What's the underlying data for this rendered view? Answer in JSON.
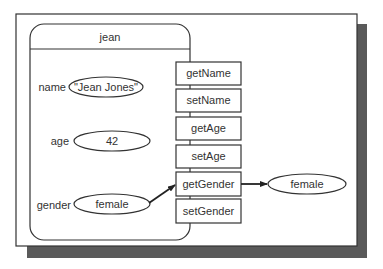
{
  "colors": {
    "line": "#333333",
    "shadow": "#5a5a5a",
    "background": "#ffffff"
  },
  "object": {
    "name": "jean",
    "fields": [
      {
        "label": "name",
        "value": "\"Jean Jones\""
      },
      {
        "label": "age",
        "value": "42"
      },
      {
        "label": "gender",
        "value": "female"
      }
    ]
  },
  "methods": [
    "getName",
    "setName",
    "getAge",
    "setAge",
    "getGender",
    "setGender"
  ],
  "returned_value": "female"
}
